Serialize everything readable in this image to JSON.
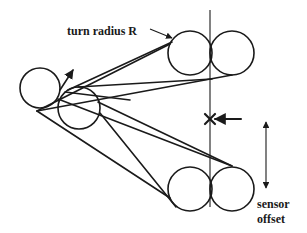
{
  "diagram": {
    "labels": {
      "turn_radius": "turn radius R",
      "sensor_line1": "sensor",
      "sensor_line2": "offset"
    },
    "colors": {
      "ink": "#1a1a1a",
      "background": "#ffffff"
    },
    "elements": {
      "start_circle": "large circle at left (starting turn circle)",
      "small_circle": "smaller overlapping circle",
      "top_circle_pair": "two tangent circles, top right",
      "bottom_circle_pair": "two tangent circles, bottom right",
      "vertical_line": "sensor reference line",
      "target_mark": "X mark with pointer arrow",
      "offset_arrow": "double-headed arrow indicating sensor offset"
    }
  }
}
